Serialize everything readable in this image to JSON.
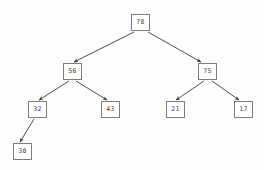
{
  "diagram": {
    "type": "binary-tree",
    "title": "",
    "background_color": "#fdfdfd",
    "node_fill": "#ffffff",
    "node_border_color": "#7d7d7d",
    "node_text_color": "#3d3d3d",
    "edge_color": "#3a3a3a",
    "node_width": 19,
    "node_height": 17
  },
  "nodes": [
    {
      "id": "n78",
      "label": "78",
      "x": 131,
      "y": 14,
      "level": 0
    },
    {
      "id": "n56",
      "label": "56",
      "x": 63,
      "y": 63,
      "level": 1
    },
    {
      "id": "n75",
      "label": "75",
      "x": 198,
      "y": 63,
      "level": 1
    },
    {
      "id": "n32",
      "label": "32",
      "x": 28,
      "y": 101,
      "level": 2
    },
    {
      "id": "n43",
      "label": "43",
      "x": 101,
      "y": 101,
      "level": 2
    },
    {
      "id": "n21",
      "label": "21",
      "x": 166,
      "y": 101,
      "level": 2
    },
    {
      "id": "n17",
      "label": "17",
      "x": 234,
      "y": 101,
      "level": 2
    },
    {
      "id": "n30",
      "label": "30",
      "x": 13,
      "y": 143,
      "level": 3
    }
  ],
  "edges": [
    {
      "id": "e78-56",
      "from": "n78",
      "to": "n56",
      "from_label": "78",
      "to_label": "56",
      "x1": 134,
      "y1": 32,
      "x2": 74,
      "y2": 62,
      "side": "left"
    },
    {
      "id": "e78-75",
      "from": "n78",
      "to": "n75",
      "from_label": "78",
      "to_label": "75",
      "x1": 148,
      "y1": 32,
      "x2": 201,
      "y2": 62,
      "side": "right"
    },
    {
      "id": "e56-32",
      "from": "n56",
      "to": "n32",
      "from_label": "56",
      "to_label": "32",
      "x1": 69,
      "y1": 81,
      "x2": 39,
      "y2": 100,
      "side": "left"
    },
    {
      "id": "e56-43",
      "from": "n56",
      "to": "n43",
      "from_label": "56",
      "to_label": "43",
      "x1": 76,
      "y1": 81,
      "x2": 107,
      "y2": 100,
      "side": "right"
    },
    {
      "id": "e75-21",
      "from": "n75",
      "to": "n21",
      "from_label": "75",
      "to_label": "21",
      "x1": 204,
      "y1": 81,
      "x2": 176,
      "y2": 100,
      "side": "left"
    },
    {
      "id": "e75-17",
      "from": "n75",
      "to": "n17",
      "from_label": "75",
      "to_label": "17",
      "x1": 212,
      "y1": 81,
      "x2": 239,
      "y2": 100,
      "side": "right"
    },
    {
      "id": "e32-30",
      "from": "n32",
      "to": "n30",
      "from_label": "32",
      "to_label": "30",
      "x1": 34,
      "y1": 119,
      "x2": 20,
      "y2": 142,
      "side": "left"
    }
  ]
}
